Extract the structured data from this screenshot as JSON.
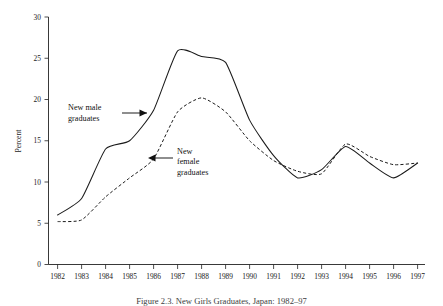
{
  "chart_data": {
    "type": "line",
    "title": "",
    "xlabel": "",
    "ylabel": "Percent",
    "ylim": [
      0,
      30
    ],
    "yticks": [
      0,
      5,
      10,
      15,
      20,
      25,
      30
    ],
    "grid": false,
    "legend_position": "inline-annotations",
    "categories": [
      "1982",
      "1983",
      "1984",
      "1985",
      "1986",
      "1987",
      "1988",
      "1989",
      "1990",
      "1991",
      "1992",
      "1993",
      "1994",
      "1995",
      "1996",
      "1997"
    ],
    "series": [
      {
        "name": "New male graduates",
        "style": "solid",
        "color": "#1b1b1b",
        "values": [
          6.0,
          8.0,
          14.0,
          15.0,
          18.7,
          25.9,
          25.2,
          24.5,
          17.5,
          13.2,
          10.5,
          11.5,
          14.3,
          12.3,
          10.5,
          12.3
        ]
      },
      {
        "name": "New female graduates",
        "style": "dashed",
        "color": "#1b1b1b",
        "values": [
          5.2,
          5.4,
          8.2,
          10.5,
          12.8,
          18.5,
          20.2,
          18.5,
          15.0,
          12.6,
          11.3,
          11.0,
          14.6,
          13.1,
          12.1,
          12.3
        ]
      }
    ],
    "annotations": [
      {
        "id": "male-annotation",
        "text_line1": "New male",
        "text_line2": "graduates",
        "arrow": "right",
        "target_x": "1985.6",
        "target_y": "18.3"
      },
      {
        "id": "female-annotation",
        "text_line1": "New",
        "text_line2": "female",
        "text_line3": "graduates",
        "arrow": "left",
        "target_x": "1985.9",
        "target_y": "12.7"
      }
    ]
  },
  "axis": {
    "y_tick_0": "0",
    "y_tick_5": "5",
    "y_tick_10": "10",
    "y_tick_15": "15",
    "y_tick_20": "20",
    "y_tick_25": "25",
    "y_tick_30": "30",
    "y_axis_title": "Percent",
    "x_tick_0": "1982",
    "x_tick_1": "1983",
    "x_tick_2": "1984",
    "x_tick_3": "1985",
    "x_tick_4": "1986",
    "x_tick_5": "1987",
    "x_tick_6": "1988",
    "x_tick_7": "1989",
    "x_tick_8": "1990",
    "x_tick_9": "1991",
    "x_tick_10": "1992",
    "x_tick_11": "1993",
    "x_tick_12": "1994",
    "x_tick_13": "1995",
    "x_tick_14": "1996",
    "x_tick_15": "1997"
  },
  "annotations_text": {
    "male_line1": "New male",
    "male_line2": "graduates",
    "female_line1": "New",
    "female_line2": "female",
    "female_line3": "graduates"
  },
  "caption": {
    "text": "Figure 2.3. New Girls Graduates, Japan: 1982–97"
  }
}
